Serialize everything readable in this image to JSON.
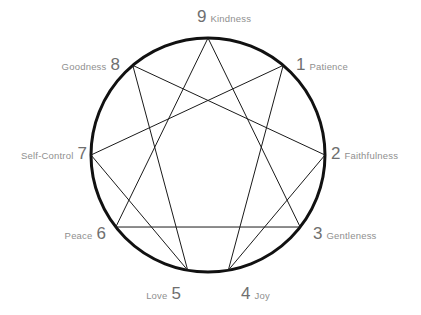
{
  "diagram": {
    "type": "enneagram",
    "title": "",
    "background_color": "#ffffff",
    "circle": {
      "center_x": 208,
      "center_y": 155,
      "radius": 117,
      "stroke_color": "#111111",
      "stroke_width": 3
    },
    "inner_lines": {
      "stroke_color": "#1a1a1a",
      "stroke_width": 1,
      "triangle": [
        9,
        3,
        6
      ],
      "hexad": [
        1,
        4,
        2,
        8,
        5,
        7
      ]
    },
    "points": [
      {
        "number": "1",
        "word": "Patience",
        "angle_deg": -50,
        "side": "right",
        "x": 292,
        "y": 83
      },
      {
        "number": "2",
        "word": "Faithfulness",
        "angle_deg": 0,
        "side": "right",
        "x": 325,
        "y": 155
      },
      {
        "number": "3",
        "word": "Gentleness",
        "angle_deg": 38,
        "side": "right",
        "x": 307,
        "y": 228
      },
      {
        "number": "4",
        "word": "Joy",
        "angle_deg": 80,
        "side": "right",
        "x": 247,
        "y": 270
      },
      {
        "number": "5",
        "word": "Love",
        "angle_deg": 100,
        "side": "left",
        "x": 172,
        "y": 270
      },
      {
        "number": "6",
        "word": "Peace",
        "angle_deg": 142,
        "side": "left",
        "x": 112,
        "y": 228
      },
      {
        "number": "7",
        "word": "Self-Control",
        "angle_deg": 180,
        "side": "left",
        "x": 92,
        "y": 155
      },
      {
        "number": "8",
        "word": "Goodness",
        "angle_deg": -130,
        "side": "left",
        "x": 125,
        "y": 83
      },
      {
        "number": "9",
        "word": "Kindness",
        "angle_deg": -90,
        "side": "right",
        "x": 207,
        "y": 40
      }
    ]
  }
}
